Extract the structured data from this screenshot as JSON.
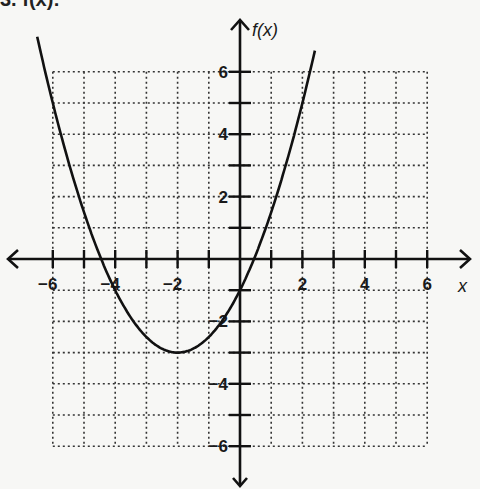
{
  "header_fragment": "3. f(x):",
  "chart_data": {
    "type": "line",
    "title": "",
    "function": "f(x) = 0.5(x + 2)^2 - 3",
    "xlabel": "x",
    "ylabel": "f(x)",
    "xlim": [
      -6,
      6
    ],
    "ylim": [
      -6,
      6
    ],
    "grid": true,
    "grid_style": "dotted",
    "x_tick_labels": [
      "-6",
      "-4",
      "-2",
      "2",
      "4",
      "6"
    ],
    "y_tick_labels": [
      "6",
      "4",
      "2",
      "-2",
      "-4",
      "-6"
    ],
    "x_ticks": [
      -6,
      -5,
      -4,
      -3,
      -2,
      -1,
      1,
      2,
      3,
      4,
      5,
      6
    ],
    "y_ticks": [
      -6,
      -5,
      -4,
      -3,
      -2,
      -1,
      1,
      2,
      3,
      4,
      5,
      6
    ],
    "vertex": [
      -2,
      -3
    ],
    "y_intercept": -1,
    "x_intercepts": [
      -4.45,
      0.45
    ],
    "series": [
      {
        "name": "f(x)",
        "x": [
          -6.5,
          -6,
          -5,
          -4,
          -3,
          -2,
          -1,
          0,
          1,
          2,
          2.4
        ],
        "y": [
          3.125,
          5,
          1.5,
          -1,
          -2.5,
          -3,
          -2.5,
          -1,
          1.5,
          5,
          6.68
        ]
      }
    ],
    "colors": {
      "curve": "#111111",
      "axes": "#111111",
      "grid": "#333333"
    }
  }
}
